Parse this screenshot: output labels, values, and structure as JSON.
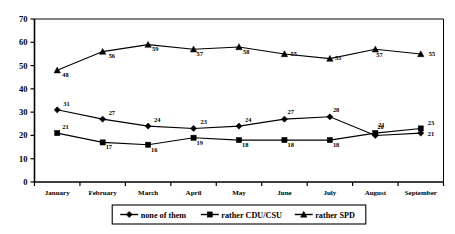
{
  "chart_data": {
    "type": "line",
    "title": "",
    "subtitle": "",
    "xlabel": "",
    "ylabel": "",
    "ylim": [
      0,
      70
    ],
    "ytick_step": 10,
    "yticks": [
      "0",
      "10",
      "20",
      "30",
      "40",
      "50",
      "60",
      "70"
    ],
    "grid": false,
    "legend_position": "bottom",
    "categories": [
      "January",
      "February",
      "March",
      "April",
      "May",
      "June",
      "July",
      "August",
      "September"
    ],
    "series": [
      {
        "name": "none of them",
        "marker": "diamond",
        "color": "#000000",
        "values": [
          31,
          27,
          24,
          23,
          24,
          27,
          28,
          20,
          21
        ],
        "labels": [
          "31",
          "27",
          "24",
          "23",
          "24",
          "27",
          "28",
          "20",
          "21"
        ]
      },
      {
        "name": "rather CDU/CSU",
        "marker": "square",
        "color": "#000000",
        "values": [
          21,
          17,
          16,
          19,
          18,
          18,
          18,
          21,
          23
        ],
        "labels": [
          "21",
          "17",
          "16",
          "19",
          "18",
          "18",
          "18",
          "21",
          "23"
        ]
      },
      {
        "name": "rather SPD",
        "marker": "triangle",
        "color": "#000000",
        "values": [
          48,
          56,
          59,
          57,
          58,
          55,
          53,
          57,
          55
        ],
        "labels": [
          "48",
          "56",
          "59",
          "57",
          "58",
          "55",
          "53",
          "57",
          "55"
        ]
      }
    ]
  },
  "legend": {
    "items": [
      {
        "label": "none of them",
        "marker": "diamond-marker-icon"
      },
      {
        "label": "rather CDU/CSU",
        "marker": "square-marker-icon"
      },
      {
        "label": "rather SPD",
        "marker": "triangle-marker-icon"
      }
    ]
  },
  "yaxis": {
    "ticks": [
      {
        "label": "70",
        "value": 70
      },
      {
        "label": "60",
        "value": 60
      },
      {
        "label": "50",
        "value": 50
      },
      {
        "label": "40",
        "value": 40
      },
      {
        "label": "30",
        "value": 30
      },
      {
        "label": "20",
        "value": 20
      },
      {
        "label": "10",
        "value": 10
      },
      {
        "label": "0",
        "value": 0
      }
    ]
  },
  "xaxis": {
    "ticks": [
      {
        "label": "January"
      },
      {
        "label": "February"
      },
      {
        "label": "March"
      },
      {
        "label": "April"
      },
      {
        "label": "May"
      },
      {
        "label": "June"
      },
      {
        "label": "July"
      },
      {
        "label": "August"
      },
      {
        "label": "September"
      }
    ]
  },
  "point_label_offsets": {
    "none of them": [
      [
        6,
        -4
      ],
      [
        6,
        -4
      ],
      [
        6,
        -4
      ],
      [
        7,
        -4
      ],
      [
        6,
        -4
      ],
      [
        3,
        -5
      ],
      [
        3,
        -5
      ],
      [
        2,
        -6
      ],
      [
        7,
        3
      ]
    ],
    "rather CDU/CSU": [
      [
        5,
        -4
      ],
      [
        3,
        7
      ],
      [
        3,
        7
      ],
      [
        3,
        7
      ],
      [
        3,
        7
      ],
      [
        3,
        7
      ],
      [
        3,
        7
      ],
      [
        3,
        -6
      ],
      [
        7,
        -3
      ]
    ],
    "rather SPD": [
      [
        5,
        7
      ],
      [
        6,
        6
      ],
      [
        4,
        6
      ],
      [
        3,
        7
      ],
      [
        4,
        7
      ],
      [
        6,
        2
      ],
      [
        5,
        1
      ],
      [
        1,
        8
      ],
      [
        8,
        2
      ]
    ]
  }
}
